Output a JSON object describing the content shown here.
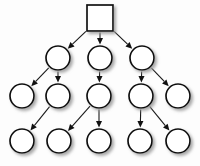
{
  "diagram": {
    "type": "tree-graph",
    "background_color": "#fdfdfd",
    "node_fill_color": "#ffffff",
    "node_stroke_color": "#111111",
    "edge_color": "#1a1a1a",
    "shadow_color": "#b4b4b4",
    "width": 200,
    "height": 166,
    "node_radius": 12,
    "square_size": 26,
    "levels": [
      {
        "index": 0,
        "y": 18,
        "count": 1
      },
      {
        "index": 1,
        "y": 58,
        "count": 3
      },
      {
        "index": 2,
        "y": 96,
        "count": 5
      },
      {
        "index": 3,
        "y": 141,
        "count": 5
      }
    ],
    "nodes": [
      {
        "id": "n0",
        "shape": "square",
        "cx": 100,
        "cy": 18,
        "level": 0,
        "label": ""
      },
      {
        "id": "n1",
        "shape": "circle",
        "cx": 58,
        "cy": 58,
        "level": 1,
        "label": ""
      },
      {
        "id": "n2",
        "shape": "circle",
        "cx": 100,
        "cy": 58,
        "level": 1,
        "label": ""
      },
      {
        "id": "n3",
        "shape": "circle",
        "cx": 142,
        "cy": 58,
        "level": 1,
        "label": ""
      },
      {
        "id": "n4",
        "shape": "circle",
        "cx": 22,
        "cy": 96,
        "level": 2,
        "label": ""
      },
      {
        "id": "n5",
        "shape": "circle",
        "cx": 58,
        "cy": 96,
        "level": 2,
        "label": ""
      },
      {
        "id": "n6",
        "shape": "circle",
        "cx": 99,
        "cy": 96,
        "level": 2,
        "label": ""
      },
      {
        "id": "n7",
        "shape": "circle",
        "cx": 141,
        "cy": 96,
        "level": 2,
        "label": ""
      },
      {
        "id": "n8",
        "shape": "circle",
        "cx": 178,
        "cy": 96,
        "level": 2,
        "label": ""
      },
      {
        "id": "n9",
        "shape": "circle",
        "cx": 22,
        "cy": 141,
        "level": 3,
        "label": ""
      },
      {
        "id": "n10",
        "shape": "circle",
        "cx": 59,
        "cy": 141,
        "level": 3,
        "label": ""
      },
      {
        "id": "n11",
        "shape": "circle",
        "cx": 99,
        "cy": 141,
        "level": 3,
        "label": ""
      },
      {
        "id": "n12",
        "shape": "circle",
        "cx": 140,
        "cy": 141,
        "level": 3,
        "label": ""
      },
      {
        "id": "n13",
        "shape": "circle",
        "cx": 178,
        "cy": 141,
        "level": 3,
        "label": ""
      }
    ],
    "edges": [
      {
        "from": "n0",
        "to": "n1",
        "directed": true
      },
      {
        "from": "n0",
        "to": "n2",
        "directed": true
      },
      {
        "from": "n0",
        "to": "n3",
        "directed": true
      },
      {
        "from": "n1",
        "to": "n4",
        "directed": true
      },
      {
        "from": "n1",
        "to": "n5",
        "directed": true
      },
      {
        "from": "n2",
        "to": "n6",
        "directed": true
      },
      {
        "from": "n3",
        "to": "n7",
        "directed": true
      },
      {
        "from": "n3",
        "to": "n8",
        "directed": true
      },
      {
        "from": "n5",
        "to": "n9",
        "directed": true
      },
      {
        "from": "n6",
        "to": "n10",
        "directed": true
      },
      {
        "from": "n6",
        "to": "n11",
        "directed": true
      },
      {
        "from": "n7",
        "to": "n12",
        "directed": true
      },
      {
        "from": "n7",
        "to": "n13",
        "directed": true
      }
    ]
  }
}
